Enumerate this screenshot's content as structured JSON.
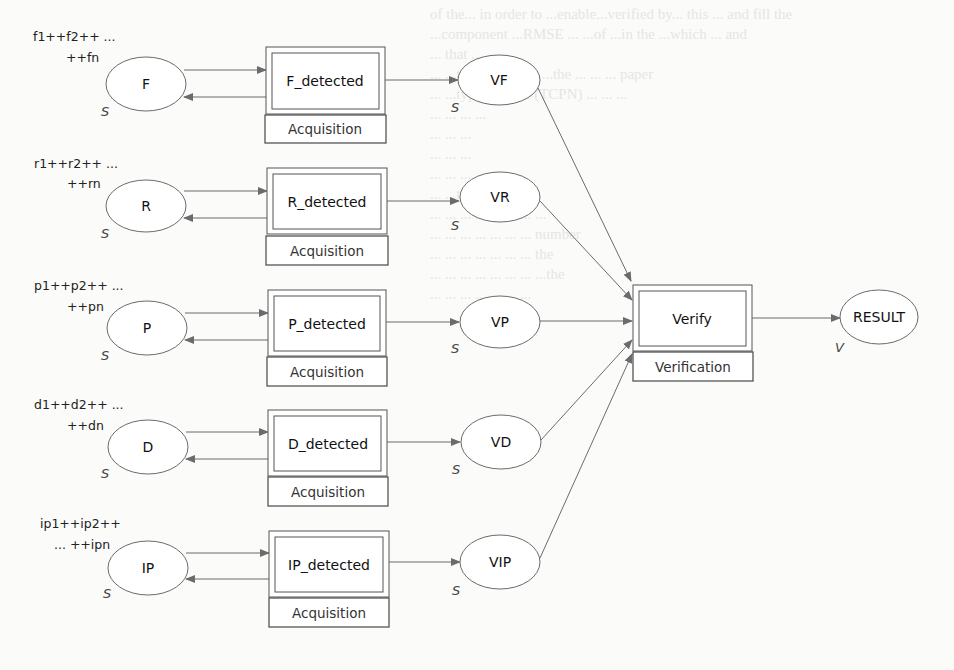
{
  "diagram": {
    "type": "Colored Petri Net / data-flow model",
    "background_bleed_through": [
      "of the... in order to ...enable...verified by... this ... and fill the",
      "...component ...RMSE ... ...of ...in the ...which ... and",
      "... that ... ...",
      "... ...the ... ...are ... ...the ... ... ... paper",
      "... ...type ... ...the (TCPN) ... ... ...",
      "",
      "... ... ... ...",
      "... ... ...",
      "... ... ...",
      "... ... ...",
      "",
      "... ...type ... ...",
      "... ... ... ... ... ... ... ...",
      "... ... ... ... ... ... ... number",
      "... ... ... ... ... ... ... the",
      "... ... ... ... ... ... ... ...the",
      "... ... ... ... ... ... ..."
    ],
    "rows": [
      {
        "id": "f",
        "sequence_line1": "f1++f2++ ...",
        "sequence_line2": "++fn",
        "input_place": "F",
        "input_type": "S",
        "transition": "F_detected",
        "transition_group": "Acquisition",
        "output_place": "VF",
        "output_type": "S"
      },
      {
        "id": "r",
        "sequence_line1": "r1++r2++ ...",
        "sequence_line2": "++rn",
        "input_place": "R",
        "input_type": "S",
        "transition": "R_detected",
        "transition_group": "Acquisition",
        "output_place": "VR",
        "output_type": "S"
      },
      {
        "id": "p",
        "sequence_line1": "p1++p2++ ...",
        "sequence_line2": "++pn",
        "input_place": "P",
        "input_type": "S",
        "transition": "P_detected",
        "transition_group": "Acquisition",
        "output_place": "VP",
        "output_type": "S"
      },
      {
        "id": "d",
        "sequence_line1": "d1++d2++ ...",
        "sequence_line2": "++dn",
        "input_place": "D",
        "input_type": "S",
        "transition": "D_detected",
        "transition_group": "Acquisition",
        "output_place": "VD",
        "output_type": "S"
      },
      {
        "id": "ip",
        "sequence_line1": "ip1++ip2++",
        "sequence_line2": "... ++ipn",
        "input_place": "IP",
        "input_type": "S",
        "transition": "IP_detected",
        "transition_group": "Acquisition",
        "output_place": "VIP",
        "output_type": "S"
      }
    ],
    "verify": {
      "transition": "Verify",
      "transition_group": "Verification"
    },
    "result": {
      "place": "RESULT",
      "type": "V"
    },
    "colors": {
      "stroke": "#6b6b6b",
      "box_stroke": "#555555",
      "text": "#111111",
      "background": "#fbfbfa"
    }
  }
}
